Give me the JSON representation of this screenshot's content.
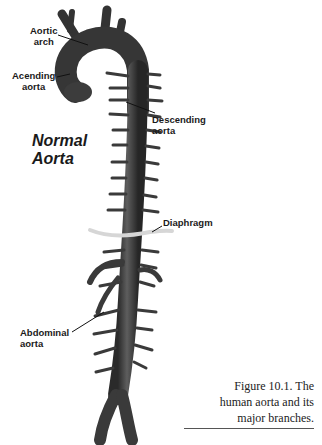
{
  "figure": {
    "title_line1": "Normal",
    "title_line2": "Aorta",
    "labels": {
      "aortic_arch_line1": "Aortic",
      "aortic_arch_line2": "arch",
      "ascending_line1": "Acending",
      "ascending_line2": "aorta",
      "descending_line1": "Descending",
      "descending_line2": "aorta",
      "diaphragm": "Diaphragm",
      "abdominal_line1": "Abdominal",
      "abdominal_line2": "aorta"
    },
    "caption": {
      "line1": "Figure 10.1. The",
      "line2": "human aorta and its",
      "line3": "major branches."
    },
    "colors": {
      "vessel": "#3a3a3a",
      "vessel_highlight": "#6a6a6a",
      "diaphragm": "#d8d8d8",
      "text": "#1a1a1a"
    }
  }
}
